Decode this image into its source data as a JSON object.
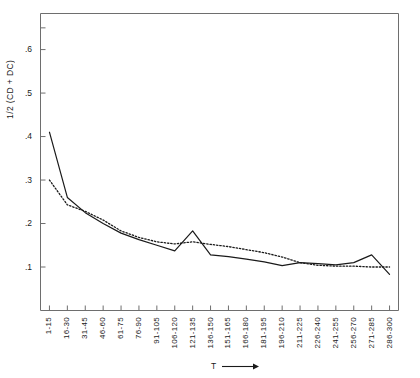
{
  "chart_data": {
    "type": "line",
    "title": "",
    "xlabel": "T",
    "ylabel": "1/2 (CD + DC)",
    "grid": false,
    "legend": "none",
    "xlim": [
      0,
      20
    ],
    "ylim": [
      0.0,
      0.683
    ],
    "ytick_labels": [
      ".1",
      ".2",
      ".3",
      ".4",
      ".5",
      ".6"
    ],
    "ytick_values": [
      0.1,
      0.2,
      0.3,
      0.4,
      0.5,
      0.6
    ],
    "categories": [
      "1-15",
      "16-30",
      "31-45",
      "46-60",
      "61-75",
      "76-90",
      "91-105",
      "106-120",
      "121-135",
      "136-150",
      "151-165",
      "166-180",
      "181-195",
      "196-210",
      "211-225",
      "226-240",
      "241-255",
      "256-270",
      "271-285",
      "286-300"
    ],
    "series": [
      {
        "name": "solid",
        "style": "solid",
        "color": "#1a1a1a",
        "values": [
          0.41,
          0.26,
          0.225,
          0.2,
          0.178,
          0.163,
          0.15,
          0.137,
          0.183,
          0.128,
          0.124,
          0.118,
          0.112,
          0.103,
          0.11,
          0.108,
          0.105,
          0.11,
          0.128,
          0.083
        ]
      },
      {
        "name": "dotted",
        "style": "dotted",
        "color": "#1a1a1a",
        "values": [
          0.3,
          0.243,
          0.228,
          0.208,
          0.183,
          0.168,
          0.158,
          0.153,
          0.158,
          0.152,
          0.147,
          0.14,
          0.133,
          0.123,
          0.11,
          0.104,
          0.102,
          0.102,
          0.1,
          0.1
        ]
      }
    ]
  },
  "axes": {
    "frame_color": "#6e6e6e",
    "tick_color": "#6e6e6e"
  }
}
